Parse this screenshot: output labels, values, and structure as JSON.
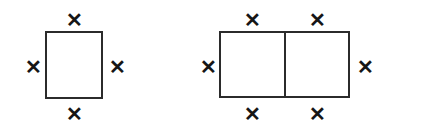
{
  "canvas": {
    "width": 436,
    "height": 133,
    "background_color": "#ffffff",
    "stroke_color": "#2b2b2b",
    "mark_color": "#161616"
  },
  "diagram": {
    "type": "geometry-perimeter-diagram",
    "figures": [
      {
        "name": "single-square",
        "shape": "square",
        "cells": 1,
        "cell_count_label": "1",
        "bounds": {
          "x": 46,
          "y": 32,
          "width": 56,
          "height": 66
        },
        "divider_x_positions": [],
        "edge_marks": [
          {
            "position": "top",
            "glyph": "✕",
            "cx": 74,
            "cy": 20
          },
          {
            "position": "left",
            "glyph": "✕",
            "cx": 33,
            "cy": 67
          },
          {
            "position": "right",
            "glyph": "✕",
            "cx": 117,
            "cy": 67
          },
          {
            "position": "bottom",
            "glyph": "✕",
            "cx": 74,
            "cy": 114
          }
        ],
        "mark_total": 4,
        "mark_total_label": "4"
      },
      {
        "name": "double-square",
        "shape": "rectangle-two-cells",
        "cells": 2,
        "cell_count_label": "2",
        "bounds": {
          "x": 220,
          "y": 32,
          "width": 129,
          "height": 65
        },
        "divider_x_positions": [
          285
        ],
        "edge_marks": [
          {
            "position": "top-left",
            "glyph": "✕",
            "cx": 252,
            "cy": 20
          },
          {
            "position": "top-right",
            "glyph": "✕",
            "cx": 317,
            "cy": 20
          },
          {
            "position": "left",
            "glyph": "✕",
            "cx": 208,
            "cy": 67
          },
          {
            "position": "right",
            "glyph": "✕",
            "cx": 365,
            "cy": 67
          },
          {
            "position": "bottom-left",
            "glyph": "✕",
            "cx": 252,
            "cy": 114
          },
          {
            "position": "bottom-right",
            "glyph": "✕",
            "cx": 317,
            "cy": 114
          }
        ],
        "mark_total": 6,
        "mark_total_label": "6"
      }
    ]
  }
}
